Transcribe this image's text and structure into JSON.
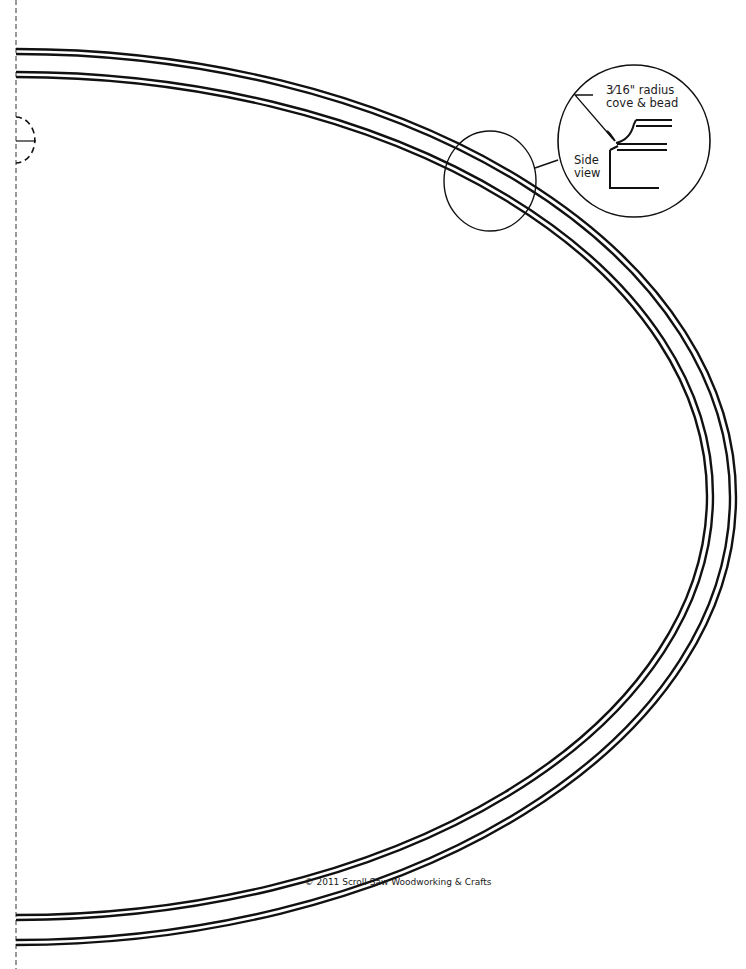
{
  "pattern": {
    "title": "Oval frame pattern (half)",
    "colors": {
      "line": "#111111",
      "background": "#ffffff"
    },
    "center_line": {
      "x": 16,
      "style": "dashed"
    },
    "outer_ring": {
      "cx": 16,
      "cy": 497,
      "rx_outer": 720,
      "ry_outer": 448,
      "rx_inner": 714,
      "ry_inner": 443
    },
    "inner_ring": {
      "cx": 16,
      "cy": 496,
      "rx_outer": 697,
      "ry_outer": 424,
      "rx_inner": 691,
      "ry_inner": 419
    }
  },
  "callout": {
    "line1": "3⁄16\" radius",
    "line2": "cove & bead",
    "side_line1": "Side",
    "side_line2": "view"
  },
  "footer": {
    "copyright": "© 2011  Scroll Saw Woodworking & Crafts"
  }
}
